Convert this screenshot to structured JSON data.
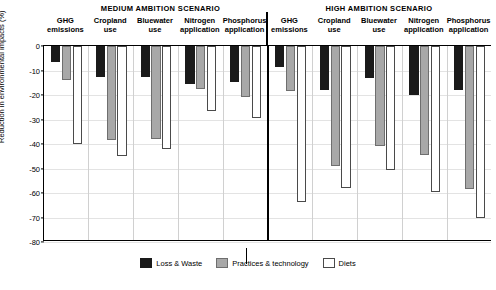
{
  "chart_data": {
    "type": "bar",
    "title": "",
    "xlabel": "",
    "ylabel": "Reduction in environmental impacts (%)",
    "ylim": [
      -80,
      0
    ],
    "ytick_labels": [
      "0",
      "-10",
      "-20",
      "-30",
      "-40",
      "-50",
      "-60",
      "-70",
      "-80"
    ],
    "ytick_values": [
      0,
      -10,
      -20,
      -30,
      -40,
      -50,
      -60,
      -70,
      -80
    ],
    "grid": true,
    "legend_position": "bottom",
    "panels": [
      {
        "name": "MEDIUM AMBITION SCENARIO",
        "categories": [
          "GHG\nemissions",
          "Cropland\nuse",
          "Bluewater\nuse",
          "Nitrogen\napplication",
          "Phosphorus\napplication"
        ],
        "series": [
          {
            "name": "Loss & Waste",
            "color": "#1a1a1a",
            "values": [
              -6.5,
              -12.5,
              -12.5,
              -15.5,
              -14.5
            ]
          },
          {
            "name": "Practices & technology",
            "color": "#a8a8a8",
            "values": [
              -14.0,
              -38.5,
              -38.0,
              -17.5,
              -21.0
            ]
          },
          {
            "name": "Diets",
            "color": "#ffffff",
            "values": [
              -40.0,
              -45.0,
              -42.0,
              -26.5,
              -29.5
            ]
          }
        ]
      },
      {
        "name": "HIGH AMBITION SCENARIO",
        "categories": [
          "GHG\nemissions",
          "Cropland\nuse",
          "Bluewater\nuse",
          "Nitrogen\napplication",
          "Phosphorus\napplication"
        ],
        "series": [
          {
            "name": "Loss & Waste",
            "color": "#1a1a1a",
            "values": [
              -8.5,
              -18.0,
              -13.0,
              -20.0,
              -18.0
            ]
          },
          {
            "name": "Practices & technology",
            "color": "#a8a8a8",
            "values": [
              -18.5,
              -49.0,
              -41.0,
              -44.5,
              -58.5
            ]
          },
          {
            "name": "Diets",
            "color": "#ffffff",
            "values": [
              -63.5,
              -58.0,
              -50.5,
              -59.5,
              -70.0
            ]
          }
        ]
      }
    ],
    "legend": [
      {
        "label": "Loss & Waste",
        "color": "#1a1a1a"
      },
      {
        "label": "Practices & technology",
        "color": "#a8a8a8"
      },
      {
        "label": "Diets",
        "color": "#ffffff"
      }
    ]
  }
}
